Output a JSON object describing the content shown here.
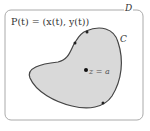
{
  "diagram": {
    "curve_label": "C",
    "domain_label": "D",
    "parametrization": "P(t) = (x(t), y(t))",
    "point_label": "z = a",
    "colors": {
      "region_fill": "#d9d9d9",
      "curve_stroke": "#444444",
      "border": "#aaaaaa"
    }
  }
}
